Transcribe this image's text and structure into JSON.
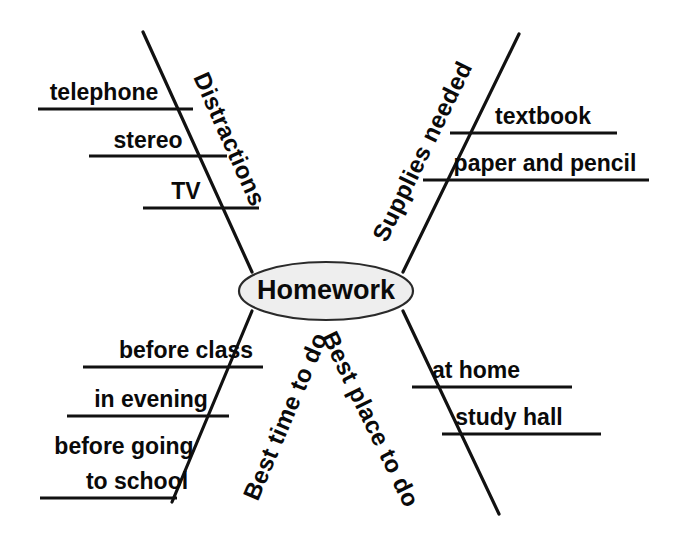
{
  "diagram": {
    "type": "mind-map",
    "title": "Homework",
    "center": {
      "label": "Homework",
      "fill_color": "#eeeeee",
      "stroke_color": "#2a2a2a",
      "cx": 326,
      "cy": 291,
      "rx": 87,
      "ry": 29
    },
    "line_color": "#111111",
    "background_color": "#ffffff",
    "branches": [
      {
        "id": "distractions",
        "label": "Distractions",
        "position": "upper-left",
        "line": {
          "x1": 143,
          "y1": 32,
          "x2": 252,
          "y2": 272
        },
        "label_x": 228,
        "label_y": 140,
        "label_rotate": 66,
        "items": [
          {
            "label": "telephone",
            "line": {
              "x1": 38,
              "y1": 109,
              "x2": 193,
              "y2": 109
            },
            "text_x": 104,
            "text_y": 100,
            "anchor": "mid"
          },
          {
            "label": "stereo",
            "line": {
              "x1": 89,
              "y1": 156,
              "x2": 227,
              "y2": 156
            },
            "text_x": 148,
            "text_y": 148,
            "anchor": "mid"
          },
          {
            "label": "TV",
            "line": {
              "x1": 143,
              "y1": 208,
              "x2": 259,
              "y2": 208
            },
            "text_x": 186,
            "text_y": 199,
            "anchor": "mid"
          }
        ]
      },
      {
        "id": "supplies-needed",
        "label": "Supplies needed",
        "position": "upper-right",
        "line": {
          "x1": 519,
          "y1": 34,
          "x2": 403,
          "y2": 272
        },
        "label_x": 424,
        "label_y": 152,
        "label_rotate": -64,
        "items": [
          {
            "label": "textbook",
            "line": {
              "x1": 450,
              "y1": 133,
              "x2": 617,
              "y2": 133
            },
            "text_x": 543,
            "text_y": 124,
            "anchor": "mid"
          },
          {
            "label": "paper and pencil",
            "line": {
              "x1": 423,
              "y1": 180,
              "x2": 649,
              "y2": 180
            },
            "text_x": 545,
            "text_y": 171,
            "anchor": "mid"
          }
        ]
      },
      {
        "id": "best-time-to-do",
        "label": "Best time to do",
        "position": "lower-left",
        "line": {
          "x1": 252,
          "y1": 311,
          "x2": 172,
          "y2": 502
        },
        "label_x": 287,
        "label_y": 417,
        "label_rotate": -67,
        "items": [
          {
            "label": "before class",
            "line": {
              "x1": 83,
              "y1": 367,
              "x2": 263,
              "y2": 367
            },
            "text_x": 186,
            "text_y": 358,
            "anchor": "mid"
          },
          {
            "label": "in evening",
            "line": {
              "x1": 67,
              "y1": 416,
              "x2": 229,
              "y2": 416
            },
            "text_x": 151,
            "text_y": 407,
            "anchor": "mid"
          },
          {
            "label": "before going",
            "line": null,
            "text_x": 124,
            "text_y": 454,
            "anchor": "mid"
          },
          {
            "label": "to school",
            "line": {
              "x1": 40,
              "y1": 498,
              "x2": 177,
              "y2": 498
            },
            "text_x": 137,
            "text_y": 489,
            "anchor": "mid"
          }
        ]
      },
      {
        "id": "best-place-to-do",
        "label": "Best place to do",
        "position": "lower-right",
        "line": {
          "x1": 403,
          "y1": 311,
          "x2": 499,
          "y2": 514
        },
        "label_x": 369,
        "label_y": 420,
        "label_rotate": 64,
        "items": [
          {
            "label": "at home",
            "line": {
              "x1": 412,
              "y1": 387,
              "x2": 572,
              "y2": 387
            },
            "text_x": 476,
            "text_y": 378,
            "anchor": "mid"
          },
          {
            "label": "study hall",
            "line": {
              "x1": 442,
              "y1": 434,
              "x2": 601,
              "y2": 434
            },
            "text_x": 509,
            "text_y": 425,
            "anchor": "mid"
          }
        ]
      }
    ]
  }
}
